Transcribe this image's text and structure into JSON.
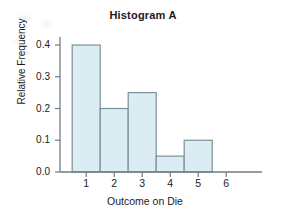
{
  "chart_data": {
    "type": "bar",
    "title": "Histogram A",
    "xlabel": "Outcome on Die",
    "ylabel": "Relative Frequency",
    "categories": [
      "1",
      "2",
      "3",
      "4",
      "5",
      "6"
    ],
    "values": [
      0.4,
      0.2,
      0.25,
      0.05,
      0.1,
      0.0
    ],
    "ylim": [
      0.0,
      0.44
    ],
    "xlim": [
      0.35,
      6.85
    ],
    "yticks": [
      "0.0",
      "0.1",
      "0.2",
      "0.3",
      "0.4"
    ],
    "ytick_values": [
      0.0,
      0.1,
      0.2,
      0.3,
      0.4
    ],
    "xticks": [
      "1",
      "2",
      "3",
      "4",
      "5",
      "6"
    ],
    "grid": false,
    "legend": false,
    "bar_width": 1.0,
    "colors": {
      "bar_fill": "#dcecf3",
      "bar_edge": "#7b9199",
      "axis": "#6f7d82",
      "text": "#1b1b1b",
      "background": "#ffffff"
    }
  }
}
